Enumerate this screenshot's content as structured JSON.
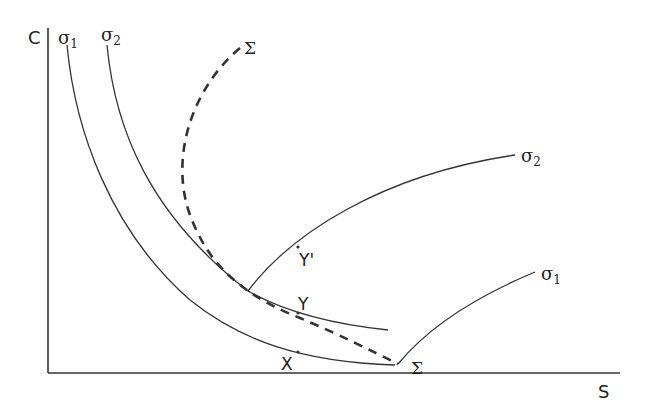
{
  "diagram": {
    "axes": {
      "y_label": "C",
      "x_label": "S"
    },
    "curves": {
      "sigma1_left": {
        "label": "σ",
        "subscript": "1"
      },
      "sigma2_left": {
        "label": "σ",
        "subscript": "2"
      },
      "sigma2_right": {
        "label": "σ",
        "subscript": "2"
      },
      "sigma1_right": {
        "label": "σ",
        "subscript": "1"
      },
      "sigma_top": {
        "label": "Σ"
      },
      "sigma_bottom": {
        "label": "Σ"
      }
    },
    "points": {
      "X": "X",
      "Y": "Y",
      "Yprime": "Y'"
    },
    "colors": {
      "line": "#333333",
      "background": "#ffffff"
    }
  }
}
